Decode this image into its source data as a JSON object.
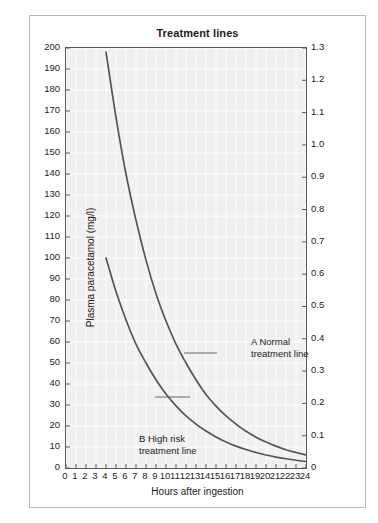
{
  "chart_data": {
    "type": "line",
    "title": "Treatment lines",
    "xlabel": "Hours after ingestion",
    "ylabel": "Plasma paracetamol (mg/l)",
    "ylabel_right": "Plasma paracetamol (mmol/l)",
    "xlim": [
      0,
      24
    ],
    "ylim": [
      0,
      200
    ],
    "ylim_right": [
      0,
      1.3
    ],
    "grid": true,
    "legend": "none",
    "xticks": [
      0,
      1,
      2,
      3,
      4,
      5,
      6,
      7,
      8,
      9,
      10,
      11,
      12,
      13,
      14,
      15,
      16,
      17,
      18,
      19,
      20,
      21,
      22,
      23,
      24
    ],
    "yticks_left": [
      0,
      10,
      20,
      30,
      40,
      50,
      60,
      70,
      80,
      90,
      100,
      110,
      120,
      130,
      140,
      150,
      160,
      170,
      180,
      190,
      200
    ],
    "yticks_right": [
      "0",
      "0.1",
      "0.2",
      "0.3",
      "0.4",
      "0.5",
      "0.6",
      "0.7",
      "0.8",
      "0.9",
      "1.0",
      "1.1",
      "1.2",
      "1.3"
    ],
    "series": [
      {
        "name": "A Normal treatment line",
        "label_line1": "A Normal",
        "label_line2": "treatment line",
        "color": "#50565a",
        "x": [
          4,
          5,
          6,
          7,
          8,
          9,
          10,
          11,
          12,
          13,
          14,
          15,
          16,
          17,
          18,
          19,
          20,
          21,
          22,
          23,
          24
        ],
        "values": [
          198,
          167,
          140,
          118,
          99,
          83,
          70,
          59,
          50,
          42,
          35,
          29.5,
          24.8,
          20.9,
          17.5,
          14.7,
          12.4,
          10.4,
          8.7,
          7.4,
          6.2
        ]
      },
      {
        "name": "B High risk treatment line",
        "label_line1": "B High risk",
        "label_line2": "treatment line",
        "color": "#50565a",
        "x": [
          4,
          5,
          6,
          7,
          8,
          9,
          10,
          11,
          12,
          13,
          14,
          15,
          16,
          17,
          18,
          19,
          20,
          21,
          22,
          23,
          24
        ],
        "values": [
          100,
          84,
          70.5,
          59,
          50,
          42,
          35.2,
          29.6,
          24.8,
          20.9,
          17.6,
          14.8,
          12.4,
          10.4,
          8.8,
          7.4,
          6.2,
          5.2,
          4.4,
          3.7,
          3.1
        ]
      }
    ],
    "colors": {
      "plot_background": "#f0f0f0",
      "gridline": "#ffffff",
      "axis": "#555a5e",
      "curve": "#50565a",
      "frame": "#b8b8b8",
      "text": "#1b1b1b"
    }
  }
}
